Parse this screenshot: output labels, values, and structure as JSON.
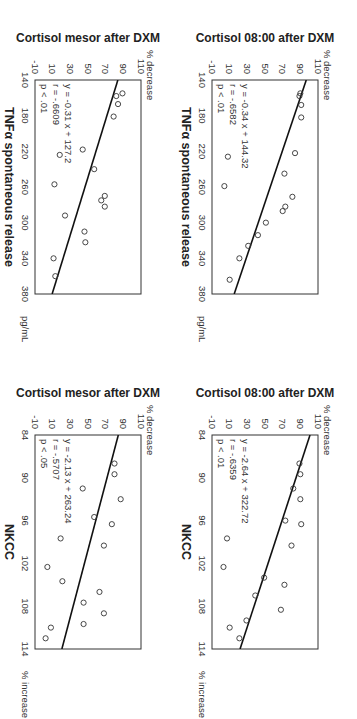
{
  "chart_data": [
    {
      "type": "scatter",
      "id": "cortisol-mesor-vs-tnf",
      "xlabel": "TNFα spontaneous release",
      "x_unit": "pg/mL",
      "ylabel": "Cortisol mesor after DXM",
      "y_unit": "% decrease",
      "xlim": [
        140,
        380
      ],
      "ylim": [
        -10,
        110
      ],
      "xticks": [
        140,
        180,
        220,
        260,
        300,
        340,
        380
      ],
      "yticks": [
        -10,
        10,
        30,
        50,
        70,
        90,
        110
      ],
      "grid": false,
      "points": [
        {
          "x": 155,
          "y": 89
        },
        {
          "x": 158,
          "y": 82
        },
        {
          "x": 167,
          "y": 84
        },
        {
          "x": 181,
          "y": 79
        },
        {
          "x": 218,
          "y": 44
        },
        {
          "x": 224,
          "y": 18
        },
        {
          "x": 240,
          "y": 57
        },
        {
          "x": 257,
          "y": 12
        },
        {
          "x": 270,
          "y": 69
        },
        {
          "x": 275,
          "y": 65
        },
        {
          "x": 282,
          "y": 69
        },
        {
          "x": 292,
          "y": 24
        },
        {
          "x": 310,
          "y": 46
        },
        {
          "x": 322,
          "y": 47
        },
        {
          "x": 340,
          "y": 11
        },
        {
          "x": 360,
          "y": 13
        }
      ],
      "regression": {
        "slope": -0.31,
        "intercept": 127.2
      },
      "annotation": {
        "equation": "y = -0.31 x + 127.2",
        "r": "r = -.6609",
        "p": "p < .01"
      }
    },
    {
      "type": "scatter",
      "id": "cortisol-0800-vs-tnf",
      "xlabel": "TNFα spontaneous release",
      "x_unit": "pg/mL",
      "ylabel": "Cortisol 08:00 after DXM",
      "y_unit": "% decrease",
      "xlim": [
        140,
        380
      ],
      "ylim": [
        -10,
        110
      ],
      "xticks": [
        140,
        180,
        220,
        260,
        300,
        340,
        380
      ],
      "yticks": [
        -10,
        10,
        30,
        50,
        70,
        90,
        110
      ],
      "grid": false,
      "points": [
        {
          "x": 155,
          "y": 90
        },
        {
          "x": 158,
          "y": 89
        },
        {
          "x": 168,
          "y": 91
        },
        {
          "x": 182,
          "y": 91
        },
        {
          "x": 222,
          "y": 84
        },
        {
          "x": 226,
          "y": 8
        },
        {
          "x": 245,
          "y": 72
        },
        {
          "x": 259,
          "y": 4
        },
        {
          "x": 271,
          "y": 81
        },
        {
          "x": 282,
          "y": 73
        },
        {
          "x": 287,
          "y": 70
        },
        {
          "x": 300,
          "y": 51
        },
        {
          "x": 314,
          "y": 42
        },
        {
          "x": 326,
          "y": 31
        },
        {
          "x": 340,
          "y": 21
        },
        {
          "x": 364,
          "y": 10
        }
      ],
      "regression": {
        "slope": -0.34,
        "intercept": 144.32
      },
      "annotation": {
        "equation": "y = -0.34 x + 144.32",
        "r": "r = -.6582",
        "p": "p < .01"
      }
    },
    {
      "type": "scatter",
      "id": "cortisol-mesor-vs-nkcc",
      "xlabel": "NKCC",
      "x_unit": "% increase",
      "ylabel": "Cortisol mesor after DXM",
      "y_unit": "% decrease",
      "xlim": [
        84,
        114
      ],
      "ylim": [
        -10,
        110
      ],
      "xticks": [
        84,
        90,
        96,
        102,
        108,
        114
      ],
      "yticks": [
        -10,
        10,
        30,
        50,
        70,
        90,
        110
      ],
      "grid": false,
      "points": [
        {
          "x": 88,
          "y": 80
        },
        {
          "x": 89.5,
          "y": 80
        },
        {
          "x": 91.5,
          "y": 44
        },
        {
          "x": 93,
          "y": 87
        },
        {
          "x": 95.5,
          "y": 57
        },
        {
          "x": 96.5,
          "y": 77
        },
        {
          "x": 98.5,
          "y": 19
        },
        {
          "x": 99.5,
          "y": 68
        },
        {
          "x": 102.5,
          "y": 4
        },
        {
          "x": 104.5,
          "y": 21
        },
        {
          "x": 106,
          "y": 63
        },
        {
          "x": 107.5,
          "y": 45
        },
        {
          "x": 109,
          "y": 68
        },
        {
          "x": 110.5,
          "y": 45
        },
        {
          "x": 111,
          "y": 8
        },
        {
          "x": 112.5,
          "y": 2
        }
      ],
      "regression": {
        "slope": -2.13,
        "intercept": 263.24
      },
      "annotation": {
        "equation": "y = -2.13 x + 263.24",
        "r": "r = -.5707",
        "p": "p < .05"
      }
    },
    {
      "type": "scatter",
      "id": "cortisol-0800-vs-nkcc",
      "xlabel": "NKCC",
      "x_unit": "% increase",
      "ylabel": "Cortisol 08:00 after DXM",
      "y_unit": "% decrease",
      "xlim": [
        84,
        114
      ],
      "ylim": [
        -10,
        110
      ],
      "xticks": [
        84,
        90,
        96,
        102,
        108,
        114
      ],
      "yticks": [
        -10,
        10,
        30,
        50,
        70,
        90,
        110
      ],
      "grid": false,
      "points": [
        {
          "x": 88,
          "y": 89
        },
        {
          "x": 89.5,
          "y": 90
        },
        {
          "x": 91.5,
          "y": 82
        },
        {
          "x": 93,
          "y": 90
        },
        {
          "x": 96,
          "y": 73
        },
        {
          "x": 96.5,
          "y": 91
        },
        {
          "x": 98.5,
          "y": 7
        },
        {
          "x": 99.5,
          "y": 80
        },
        {
          "x": 102.5,
          "y": 3
        },
        {
          "x": 104,
          "y": 49
        },
        {
          "x": 105,
          "y": 72
        },
        {
          "x": 106.5,
          "y": 39
        },
        {
          "x": 108.5,
          "y": 68
        },
        {
          "x": 110,
          "y": 29
        },
        {
          "x": 111,
          "y": 10
        },
        {
          "x": 112.5,
          "y": 21
        }
      ],
      "regression": {
        "slope": -2.64,
        "intercept": 322.72
      },
      "annotation": {
        "equation": "y = -2.64 x + 322.72",
        "r": "r = -.6359",
        "p": "p < .01"
      }
    }
  ],
  "panels": [
    {
      "ylabel": "Cortisol mesor after DXM",
      "y_unit": "% decrease",
      "xlabel": "TNFα spontaneous release",
      "x_unit": "pg/mL",
      "eq": "y = -0.31 x + 127.2",
      "r": "r = -.6609",
      "p": "p < .01"
    },
    {
      "ylabel": "Cortisol 08:00 after DXM",
      "y_unit": "% decrease",
      "xlabel": "TNFα spontaneous release",
      "x_unit": "pg/mL",
      "eq": "y = -0.34 x + 144.32",
      "r": "r = -.6582",
      "p": "p < .01"
    },
    {
      "ylabel": "Cortisol mesor after DXM",
      "y_unit": "% decrease",
      "xlabel": "NKCC",
      "x_unit": "% increase",
      "eq": "y = -2.13 x + 263.24",
      "r": "r = -.5707",
      "p": "p < .05"
    },
    {
      "ylabel": "Cortisol 08:00 after DXM",
      "y_unit": "% decrease",
      "xlabel": "NKCC",
      "x_unit": "% increase",
      "eq": "y = -2.64 x + 322.72",
      "r": "r = -.6359",
      "p": "p < .01"
    }
  ]
}
